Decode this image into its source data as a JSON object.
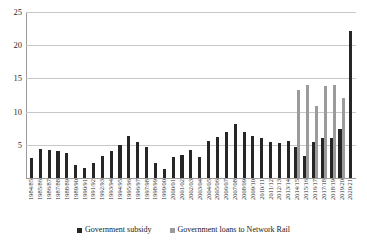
{
  "chart_data": {
    "type": "bar",
    "title": "",
    "subtitle": "",
    "xlabel": "",
    "ylabel": "",
    "ylim": [
      0,
      25
    ],
    "yticks": [
      0,
      5,
      10,
      15,
      20,
      25
    ],
    "ytick_labels": [
      "",
      "5",
      "10",
      "15",
      "20",
      "25"
    ],
    "grid": true,
    "legend_position": "bottom",
    "stacked": true,
    "categories": [
      "1984/85",
      "1985/86",
      "1986/87",
      "1987/88",
      "1988/89",
      "1989/90",
      "1990/91",
      "1991/92",
      "1992/93",
      "1993/94",
      "1994/95",
      "1995/96",
      "1996/97",
      "1997/98",
      "1998/99",
      "1999/00",
      "2000/01",
      "2001/02",
      "2002/03",
      "2003/04",
      "2004/05",
      "2005/06",
      "2006/07",
      "2007/08",
      "2008/09",
      "2009/10",
      "2010/11",
      "2011/12",
      "2012/13",
      "2013/14",
      "2014/15",
      "2015/16",
      "2016/17",
      "2017/18",
      "2018/19",
      "2019/20",
      "2020/21"
    ],
    "series": [
      {
        "name": "Government subsidy",
        "color": "#262626",
        "values": [
          3.0,
          4.3,
          4.2,
          4.0,
          3.7,
          2.0,
          1.5,
          2.2,
          3.3,
          4.0,
          5.0,
          6.4,
          5.4,
          4.7,
          2.2,
          1.4,
          3.1,
          3.5,
          4.2,
          3.1,
          5.6,
          6.2,
          6.9,
          8.2,
          6.9,
          6.4,
          6.1,
          5.4,
          5.3,
          5.5,
          4.6,
          3.3,
          5.4,
          6.0,
          6.0,
          7.4,
          22.2
        ]
      },
      {
        "name": "Government loans to Network Rail",
        "color": "#9b9b9b",
        "values": [
          0,
          0,
          0,
          0,
          0,
          0,
          0,
          0,
          0,
          0,
          0,
          0,
          0,
          0,
          0,
          0,
          0,
          0,
          0,
          0,
          0,
          0,
          0,
          0,
          0,
          0,
          0,
          0,
          0,
          0,
          13.2,
          14.0,
          10.9,
          13.9,
          14.0,
          12.0,
          0
        ]
      }
    ]
  },
  "legend": {
    "items": [
      {
        "label": "Government subsidy",
        "color": "#262626"
      },
      {
        "label": "Government loans to Network Rail",
        "color": "#9b9b9b"
      }
    ]
  }
}
